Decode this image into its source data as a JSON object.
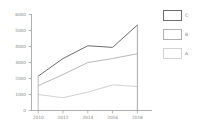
{
  "chart_data": {
    "type": "line",
    "title": "",
    "xlabel": "",
    "ylabel": "",
    "x": [
      2010,
      2012,
      2014,
      2016,
      2018
    ],
    "categories": [
      "2010",
      "2012",
      "2014",
      "2016",
      "2018"
    ],
    "series": [
      {
        "name": "C",
        "values": [
          2150,
          3250,
          4050,
          3950,
          5350
        ],
        "color": "#6b6b6b"
      },
      {
        "name": "B",
        "values": [
          1550,
          2250,
          3000,
          3250,
          3550
        ],
        "color": "#b0b0b0"
      },
      {
        "name": "A",
        "values": [
          1000,
          800,
          1150,
          1600,
          1500
        ],
        "color": "#c8c8c8"
      }
    ],
    "xlim": [
      2009.2,
      2018.6
    ],
    "ylim": [
      0,
      6000
    ],
    "yticks": [
      0,
      1000,
      2000,
      3000,
      4000,
      5000,
      6000
    ],
    "ytick_labels": [
      "0",
      "1000",
      "2000",
      "3000",
      "4000",
      "5000",
      "6000"
    ],
    "xticks": [
      2010,
      2012,
      2014,
      2016,
      2018
    ],
    "xtick_labels": [
      "2010",
      "2012",
      "2014",
      "2016",
      "2018"
    ],
    "grid": false,
    "legend_position": "right",
    "legend_entries": [
      {
        "label": "C",
        "color": "#6b6b6b"
      },
      {
        "label": "B",
        "color": "#b0b0b0"
      },
      {
        "label": "A",
        "color": "#d2d2d2"
      }
    ]
  },
  "axes": {
    "y_labels": [
      "6000",
      "5000",
      "4000",
      "3000",
      "2000",
      "1000",
      "0"
    ],
    "x_labels": [
      "2010",
      "2012",
      "2014",
      "2016",
      "2018"
    ]
  },
  "legend": {
    "items": [
      {
        "label": "C"
      },
      {
        "label": "B"
      },
      {
        "label": "A"
      }
    ]
  },
  "colors": {
    "series_c": "#6b6b6b",
    "series_b": "#b0b0b0",
    "series_a": "#cccccc",
    "axis": "#9a9a9a",
    "text": "#8a8a8a",
    "background": "#ffffff"
  }
}
